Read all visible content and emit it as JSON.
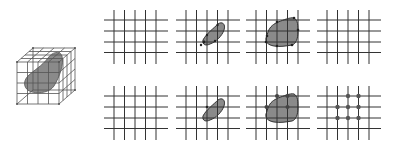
{
  "figure": {
    "colors": {
      "background": "#ffffff",
      "grid_line": "#333333",
      "cube_line": "#555555",
      "blob_fill": "#8a8a8a",
      "blob_stroke": "#444444",
      "point": "#333333"
    },
    "cube": {
      "label": "3d-voxel-cube-with-blob"
    },
    "rows": [
      {
        "name": "top-row",
        "panels": [
          {
            "name": "empty-grid",
            "blob": "none",
            "points": []
          },
          {
            "name": "small-blob-grid",
            "blob": "small",
            "points": []
          },
          {
            "name": "large-blob-grid",
            "blob": "large",
            "points": []
          },
          {
            "name": "empty-grid-result",
            "blob": "none",
            "points": []
          }
        ]
      },
      {
        "name": "bottom-row",
        "panels": [
          {
            "name": "empty-grid",
            "blob": "none",
            "points": []
          },
          {
            "name": "small-blob-grid",
            "blob": "small",
            "points": []
          },
          {
            "name": "large-blob-grid-with-points",
            "blob": "large",
            "points": [
              [
                2,
                0
              ],
              [
                3,
                0
              ],
              [
                1,
                1
              ],
              [
                3,
                1
              ]
            ]
          },
          {
            "name": "points-grid-result",
            "blob": "none",
            "points": [
              [
                2,
                0
              ],
              [
                3,
                0
              ],
              [
                1,
                1
              ],
              [
                2,
                1
              ],
              [
                3,
                1
              ],
              [
                1,
                2
              ],
              [
                2,
                2
              ],
              [
                3,
                2
              ]
            ]
          }
        ]
      }
    ]
  }
}
